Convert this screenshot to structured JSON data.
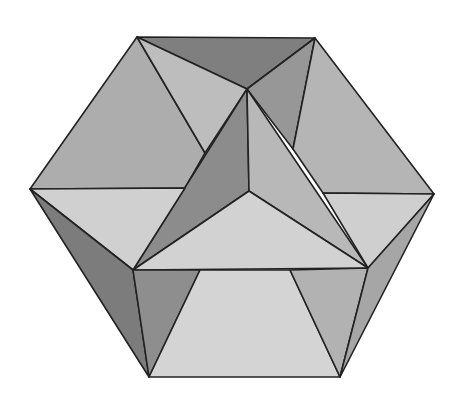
{
  "diagram": {
    "type": "polyhedron-line-drawing",
    "colors": {
      "stroke": "#222222",
      "light": "#d6d6d6",
      "mid_light": "#c2c2c2",
      "mid": "#acacac",
      "dark": "#8e8e8e",
      "darker": "#7c7c7c"
    }
  }
}
